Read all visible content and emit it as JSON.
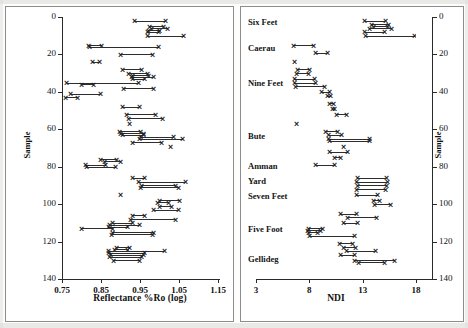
{
  "figure": {
    "kind": "two-panel-stratigraphic-scatter",
    "background": "#ffffff",
    "ink_color": "#2d2d2d"
  },
  "panels": {
    "left": {
      "name": "reflectance-panel",
      "x_title": "Reflectance %Ro (log)",
      "y_title": "Sample",
      "x_ticks": [
        "0.75",
        "0.85",
        "0.95",
        "1.05",
        "1.15"
      ],
      "y_ticks": [
        "0",
        "20",
        "40",
        "60",
        "80",
        "100",
        "120",
        "140"
      ]
    },
    "right": {
      "name": "ndi-panel",
      "x_title": "NDI",
      "y_title": "Sample",
      "x_ticks": [
        "3",
        "8",
        "13",
        "18"
      ],
      "y_ticks": [
        "0",
        "20",
        "40",
        "60",
        "80",
        "100",
        "120",
        "140"
      ],
      "seam_labels": [
        {
          "label": "Six Feet",
          "sample": 3
        },
        {
          "label": "Caerau",
          "sample": 17
        },
        {
          "label": "Nine Feet",
          "sample": 36
        },
        {
          "label": "Bute",
          "sample": 64
        },
        {
          "label": "Amman",
          "sample": 80
        },
        {
          "label": "Yard",
          "sample": 88
        },
        {
          "label": "Seven Feet",
          "sample": 96
        },
        {
          "label": "Five Foot",
          "sample": 114
        },
        {
          "label": "Gellideg",
          "sample": 130
        }
      ]
    }
  },
  "chart_data": [
    {
      "type": "scatter",
      "name": "reflectance-vs-sample",
      "title": "",
      "xlabel": "Reflectance %Ro (log)",
      "ylabel": "Sample",
      "xlim": [
        0.75,
        1.15
      ],
      "ylim": [
        0,
        140
      ],
      "y_inverted": true,
      "grid": false,
      "legend": null,
      "marker": "x",
      "note": "Each record is a horizontal range (min-max reflectance) at one sample depth, drawn as a line with x markers at both ends.",
      "records": [
        {
          "sample": 2,
          "xmin": 0.935,
          "xmax": 1.015
        },
        {
          "sample": 5,
          "xmin": 0.975,
          "xmax": 1.01
        },
        {
          "sample": 6,
          "xmin": 0.98,
          "xmax": 1.02
        },
        {
          "sample": 7,
          "xmin": 0.972,
          "xmax": 1.0
        },
        {
          "sample": 8,
          "xmin": 0.968,
          "xmax": 0.998
        },
        {
          "sample": 10,
          "xmin": 0.97,
          "xmax": 1.062
        },
        {
          "sample": 15,
          "xmin": 0.818,
          "xmax": 0.852
        },
        {
          "sample": 16,
          "xmin": 0.82,
          "xmax": 0.998
        },
        {
          "sample": 20,
          "xmin": 0.9,
          "xmax": 0.982
        },
        {
          "sample": 24,
          "xmin": 0.828,
          "xmax": 0.845
        },
        {
          "sample": 28,
          "xmin": 0.905,
          "xmax": 0.955
        },
        {
          "sample": 30,
          "xmin": 0.92,
          "xmax": 0.968
        },
        {
          "sample": 31,
          "xmin": 0.93,
          "xmax": 0.972
        },
        {
          "sample": 32,
          "xmin": 0.928,
          "xmax": 0.984
        },
        {
          "sample": 33,
          "xmin": 0.93,
          "xmax": 0.962
        },
        {
          "sample": 35,
          "xmin": 0.762,
          "xmax": 0.945
        },
        {
          "sample": 36,
          "xmin": 0.8,
          "xmax": 0.83
        },
        {
          "sample": 38,
          "xmin": 0.908,
          "xmax": 0.985
        },
        {
          "sample": 41,
          "xmin": 0.772,
          "xmax": 0.848
        },
        {
          "sample": 43,
          "xmin": 0.758,
          "xmax": 0.79
        },
        {
          "sample": 48,
          "xmin": 0.905,
          "xmax": 0.948
        },
        {
          "sample": 52,
          "xmin": 0.915,
          "xmax": 0.99
        },
        {
          "sample": 54,
          "xmin": 0.92,
          "xmax": 1.008
        },
        {
          "sample": 57,
          "xmin": 0.922,
          "xmax": 0.922
        },
        {
          "sample": 61,
          "xmin": 0.898,
          "xmax": 0.952
        },
        {
          "sample": 62,
          "xmin": 0.9,
          "xmax": 0.96
        },
        {
          "sample": 63,
          "xmin": 0.905,
          "xmax": 0.958
        },
        {
          "sample": 64,
          "xmin": 0.95,
          "xmax": 1.035
        },
        {
          "sample": 65,
          "xmin": 0.948,
          "xmax": 1.06
        },
        {
          "sample": 67,
          "xmin": 0.93,
          "xmax": 1.005
        },
        {
          "sample": 69,
          "xmin": 1.028,
          "xmax": 1.028
        },
        {
          "sample": 76,
          "xmin": 0.848,
          "xmax": 0.89
        },
        {
          "sample": 77,
          "xmin": 0.858,
          "xmax": 0.9
        },
        {
          "sample": 79,
          "xmin": 0.81,
          "xmax": 0.862
        },
        {
          "sample": 80,
          "xmin": 0.812,
          "xmax": 0.888
        },
        {
          "sample": 86,
          "xmin": 0.932,
          "xmax": 0.962
        },
        {
          "sample": 88,
          "xmin": 0.946,
          "xmax": 1.066
        },
        {
          "sample": 90,
          "xmin": 0.955,
          "xmax": 1.04
        },
        {
          "sample": 91,
          "xmin": 0.952,
          "xmax": 1.048
        },
        {
          "sample": 95,
          "xmin": 0.9,
          "xmax": 0.9
        },
        {
          "sample": 98,
          "xmin": 1.0,
          "xmax": 1.05
        },
        {
          "sample": 99,
          "xmin": 0.995,
          "xmax": 1.022
        },
        {
          "sample": 101,
          "xmin": 1.0,
          "xmax": 1.03
        },
        {
          "sample": 103,
          "xmin": 0.985,
          "xmax": 1.048
        },
        {
          "sample": 106,
          "xmin": 0.93,
          "xmax": 0.962
        },
        {
          "sample": 108,
          "xmin": 0.925,
          "xmax": 1.04
        },
        {
          "sample": 110,
          "xmin": 0.88,
          "xmax": 0.93
        },
        {
          "sample": 111,
          "xmin": 0.872,
          "xmax": 0.948
        },
        {
          "sample": 112,
          "xmin": 0.868,
          "xmax": 0.918
        },
        {
          "sample": 113,
          "xmin": 0.8,
          "xmax": 0.88
        },
        {
          "sample": 115,
          "xmin": 0.88,
          "xmax": 0.985
        },
        {
          "sample": 116,
          "xmin": 0.878,
          "xmax": 0.982
        },
        {
          "sample": 123,
          "xmin": 0.89,
          "xmax": 0.922
        },
        {
          "sample": 124,
          "xmin": 0.885,
          "xmax": 0.918
        },
        {
          "sample": 125,
          "xmin": 0.87,
          "xmax": 1.012
        },
        {
          "sample": 126,
          "xmin": 0.868,
          "xmax": 0.962
        },
        {
          "sample": 127,
          "xmin": 0.875,
          "xmax": 0.958
        },
        {
          "sample": 128,
          "xmin": 0.872,
          "xmax": 0.955
        },
        {
          "sample": 130,
          "xmin": 0.882,
          "xmax": 0.948
        }
      ]
    },
    {
      "type": "scatter",
      "name": "ndi-vs-sample",
      "title": "",
      "xlabel": "NDI",
      "ylabel": "Sample",
      "xlim": [
        3,
        18
      ],
      "ylim": [
        0,
        140
      ],
      "y_inverted": true,
      "grid": false,
      "legend": null,
      "marker": "x",
      "note": "Each record is a horizontal NDI range at one sample depth, drawn as a line with x markers at both ends.",
      "records": [
        {
          "sample": 2,
          "xmin": 13.2,
          "xmax": 15.1
        },
        {
          "sample": 4,
          "xmin": 13.8,
          "xmax": 15.4
        },
        {
          "sample": 5,
          "xmin": 14.0,
          "xmax": 15.3
        },
        {
          "sample": 6,
          "xmin": 13.6,
          "xmax": 15.7
        },
        {
          "sample": 8,
          "xmin": 13.2,
          "xmax": 15.0
        },
        {
          "sample": 10,
          "xmin": 13.3,
          "xmax": 17.9
        },
        {
          "sample": 15,
          "xmin": 6.5,
          "xmax": 8.4
        },
        {
          "sample": 19,
          "xmin": 8.6,
          "xmax": 9.7
        },
        {
          "sample": 24,
          "xmin": 6.6,
          "xmax": 6.6
        },
        {
          "sample": 28,
          "xmin": 6.9,
          "xmax": 8.0
        },
        {
          "sample": 30,
          "xmin": 6.8,
          "xmax": 7.9
        },
        {
          "sample": 33,
          "xmin": 6.6,
          "xmax": 8.5
        },
        {
          "sample": 35,
          "xmin": 6.6,
          "xmax": 8.6
        },
        {
          "sample": 37,
          "xmin": 6.7,
          "xmax": 9.4
        },
        {
          "sample": 40,
          "xmin": 9.1,
          "xmax": 9.9
        },
        {
          "sample": 42,
          "xmin": 9.7,
          "xmax": 10.0
        },
        {
          "sample": 46,
          "xmin": 9.9,
          "xmax": 10.3
        },
        {
          "sample": 49,
          "xmin": 10.2,
          "xmax": 10.4
        },
        {
          "sample": 52,
          "xmin": 10.5,
          "xmax": 11.5
        },
        {
          "sample": 57,
          "xmin": 6.8,
          "xmax": 6.8
        },
        {
          "sample": 61,
          "xmin": 9.5,
          "xmax": 10.6
        },
        {
          "sample": 63,
          "xmin": 9.8,
          "xmax": 11.0
        },
        {
          "sample": 65,
          "xmin": 9.8,
          "xmax": 13.6
        },
        {
          "sample": 66,
          "xmin": 9.9,
          "xmax": 13.6
        },
        {
          "sample": 69,
          "xmin": 11.2,
          "xmax": 11.2
        },
        {
          "sample": 72,
          "xmin": 9.9,
          "xmax": 11.6
        },
        {
          "sample": 75,
          "xmin": 10.4,
          "xmax": 10.9
        },
        {
          "sample": 79,
          "xmin": 8.6,
          "xmax": 10.4
        },
        {
          "sample": 86,
          "xmin": 12.5,
          "xmax": 15.2
        },
        {
          "sample": 88,
          "xmin": 12.4,
          "xmax": 15.3
        },
        {
          "sample": 90,
          "xmin": 12.5,
          "xmax": 15.2
        },
        {
          "sample": 92,
          "xmin": 12.4,
          "xmax": 15.1
        },
        {
          "sample": 95,
          "xmin": 12.4,
          "xmax": 14.4
        },
        {
          "sample": 98,
          "xmin": 14.0,
          "xmax": 14.6
        },
        {
          "sample": 100,
          "xmin": 14.1,
          "xmax": 15.6
        },
        {
          "sample": 105,
          "xmin": 10.9,
          "xmax": 12.4
        },
        {
          "sample": 107,
          "xmin": 11.6,
          "xmax": 14.3
        },
        {
          "sample": 110,
          "xmin": 11.2,
          "xmax": 12.5
        },
        {
          "sample": 113,
          "xmin": 7.9,
          "xmax": 9.2
        },
        {
          "sample": 114,
          "xmin": 7.8,
          "xmax": 9.0
        },
        {
          "sample": 115,
          "xmin": 7.9,
          "xmax": 8.8
        },
        {
          "sample": 117,
          "xmin": 8.0,
          "xmax": 12.2
        },
        {
          "sample": 121,
          "xmin": 10.8,
          "xmax": 12.0
        },
        {
          "sample": 123,
          "xmin": 11.2,
          "xmax": 12.3
        },
        {
          "sample": 125,
          "xmin": 11.5,
          "xmax": 14.2
        },
        {
          "sample": 127,
          "xmin": 10.9,
          "xmax": 12.2
        },
        {
          "sample": 130,
          "xmin": 12.2,
          "xmax": 16.0
        },
        {
          "sample": 131,
          "xmin": 12.6,
          "xmax": 15.0
        }
      ]
    }
  ]
}
